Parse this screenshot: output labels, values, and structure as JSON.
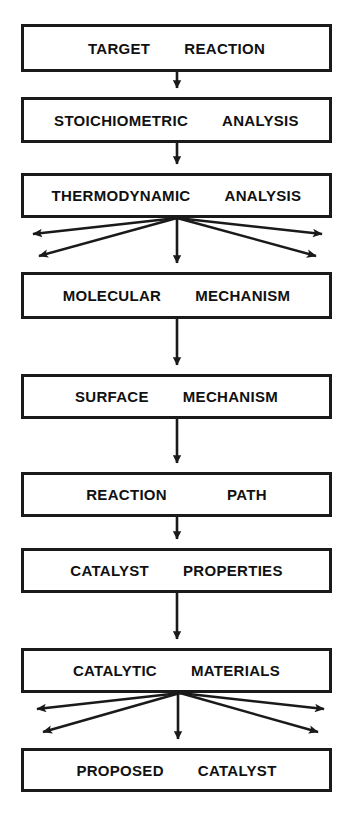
{
  "diagram": {
    "type": "flowchart",
    "orientation": "top-to-bottom",
    "colors": {
      "box_border": "#1a1a1a",
      "box_fill": "#ffffff",
      "arrow": "#1a1a1a",
      "text": "#111111",
      "background": "#ffffff"
    },
    "nodes": [
      {
        "id": "target-reaction",
        "word1": "TARGET",
        "word2": "REACTION",
        "x": 21,
        "y": 24,
        "w": 311,
        "h": 48
      },
      {
        "id": "stoichiometric-analysis",
        "word1": "STOICHIOMETRIC",
        "word2": "ANALYSIS",
        "x": 21,
        "y": 97,
        "w": 311,
        "h": 46
      },
      {
        "id": "thermodynamic-analysis",
        "word1": "THERMODYNAMIC",
        "word2": "ANALYSIS",
        "x": 21,
        "y": 173,
        "w": 311,
        "h": 45
      },
      {
        "id": "molecular-mechanism",
        "word1": "MOLECULAR",
        "word2": "MECHANISM",
        "x": 21,
        "y": 272,
        "w": 311,
        "h": 47
      },
      {
        "id": "surface-mechanism",
        "word1": "SURFACE",
        "word2": "MECHANISM",
        "x": 21,
        "y": 374,
        "w": 311,
        "h": 45
      },
      {
        "id": "reaction-path",
        "word1": "REACTION",
        "word2": "PATH",
        "x": 21,
        "y": 472,
        "w": 311,
        "h": 45
      },
      {
        "id": "catalyst-properties",
        "word1": "CATALYST",
        "word2": "PROPERTIES",
        "x": 21,
        "y": 548,
        "w": 311,
        "h": 45
      },
      {
        "id": "catalytic-materials",
        "word1": "CATALYTIC",
        "word2": "MATERIALS",
        "x": 21,
        "y": 648,
        "w": 311,
        "h": 45
      },
      {
        "id": "proposed-catalyst",
        "word1": "PROPOSED",
        "word2": "CATALYST",
        "x": 21,
        "y": 748,
        "w": 311,
        "h": 44
      }
    ],
    "connectors": [
      {
        "id": "arrow-target-to-stoichiometric",
        "kind": "vertical",
        "x": 177,
        "y1": 72,
        "y2": 95
      },
      {
        "id": "arrow-stoichiometric-to-thermodynamic",
        "kind": "vertical",
        "x": 177,
        "y1": 143,
        "y2": 171
      },
      {
        "id": "arrow-thermodynamic-down",
        "kind": "vertical",
        "x": 177,
        "y1": 218,
        "y2": 270
      },
      {
        "id": "arrow-molecular-to-surface",
        "kind": "vertical",
        "x": 177,
        "y1": 319,
        "y2": 372
      },
      {
        "id": "arrow-surface-to-reactionpath",
        "kind": "vertical",
        "x": 177,
        "y1": 419,
        "y2": 470
      },
      {
        "id": "arrow-reactionpath-to-catalyst",
        "kind": "vertical",
        "x": 177,
        "y1": 517,
        "y2": 546
      },
      {
        "id": "arrow-catalyst-to-catalytic",
        "kind": "vertical",
        "x": 177,
        "y1": 593,
        "y2": 646
      },
      {
        "id": "arrow-catalytic-down",
        "kind": "vertical",
        "x": 177,
        "y1": 693,
        "y2": 746
      }
    ],
    "fanouts": [
      {
        "id": "fanout-thermodynamic",
        "origin_x": 177,
        "origin_y": 218,
        "branches": [
          {
            "id": "branch-left-upper",
            "x2": 24,
            "y2": 235
          },
          {
            "id": "branch-left-lower",
            "x2": 30,
            "y2": 257
          },
          {
            "id": "branch-right-upper",
            "x2": 330,
            "y2": 235
          },
          {
            "id": "branch-right-lower",
            "x2": 324,
            "y2": 257
          }
        ]
      },
      {
        "id": "fanout-catalytic-materials",
        "origin_x": 180,
        "origin_y": 693,
        "branches": [
          {
            "id": "branch-left-upper",
            "x2": 28,
            "y2": 710
          },
          {
            "id": "branch-left-lower",
            "x2": 34,
            "y2": 733
          },
          {
            "id": "branch-right-upper",
            "x2": 332,
            "y2": 710
          },
          {
            "id": "branch-right-lower",
            "x2": 326,
            "y2": 733
          }
        ]
      }
    ]
  }
}
